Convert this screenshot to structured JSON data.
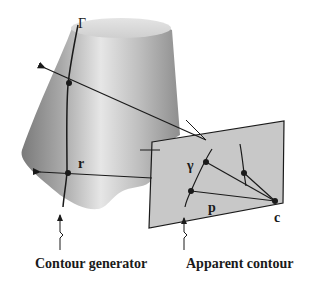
{
  "figure": {
    "labels": {
      "surface_curve": "Γ",
      "image_curve": "γ",
      "ray_point": "r",
      "image_point": "p",
      "camera_center": "c"
    },
    "captions": {
      "left": "Contour generator",
      "right": "Apparent contour"
    },
    "colors": {
      "surface_light": "#e8e8e8",
      "surface_dark": "#8a8a8a",
      "image_plane": "#c8c8c8",
      "line": "#1a1a1a"
    }
  }
}
